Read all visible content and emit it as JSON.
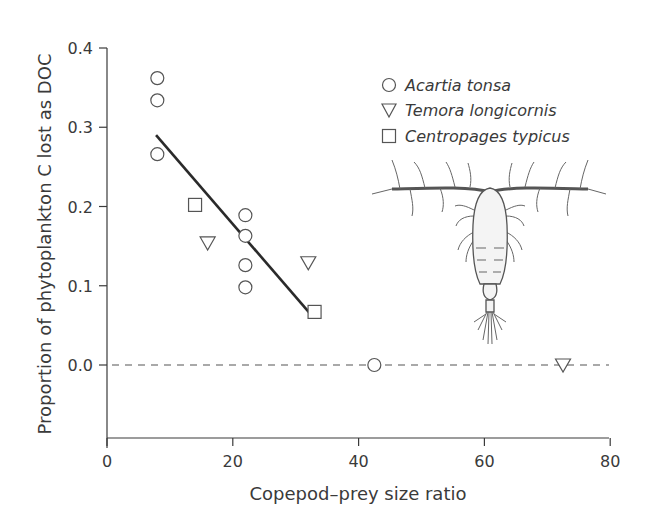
{
  "chart_data": {
    "type": "scatter",
    "title": "",
    "xlabel": "Copepod–prey size ratio",
    "ylabel": "Proportion of phytoplankton C lost as DOC",
    "xlim": [
      0,
      80
    ],
    "ylim": [
      -0.12,
      0.4
    ],
    "xticks": [
      0,
      20,
      40,
      60,
      80
    ],
    "xtick_labels": [
      "0",
      "20",
      "40",
      "60",
      "80"
    ],
    "yticks": [
      0.0,
      0.1,
      0.2,
      0.3,
      0.4
    ],
    "ytick_labels": [
      "0.0",
      "0.1",
      "0.2",
      "0.3",
      "0.4"
    ],
    "grid": false,
    "legend_position": "upper right",
    "series": [
      {
        "name": "Acartia tonsa",
        "marker": "circle",
        "points": [
          {
            "x": 8,
            "y": 0.362
          },
          {
            "x": 8,
            "y": 0.334
          },
          {
            "x": 8,
            "y": 0.266
          },
          {
            "x": 22,
            "y": 0.189
          },
          {
            "x": 22,
            "y": 0.163
          },
          {
            "x": 22,
            "y": 0.126
          },
          {
            "x": 22,
            "y": 0.098
          },
          {
            "x": 42.5,
            "y": 0.0
          }
        ]
      },
      {
        "name": "Temora longicornis",
        "marker": "triangle-down",
        "points": [
          {
            "x": 16,
            "y": 0.154
          },
          {
            "x": 32,
            "y": 0.129
          },
          {
            "x": 72.5,
            "y": 0.0
          }
        ]
      },
      {
        "name": "Centropages typicus",
        "marker": "square",
        "points": [
          {
            "x": 14,
            "y": 0.202
          },
          {
            "x": 33,
            "y": 0.067
          }
        ]
      }
    ],
    "annotations": [
      {
        "type": "regression-line",
        "from": {
          "x": 7.8,
          "y": 0.29
        },
        "to": {
          "x": 32.5,
          "y": 0.063
        }
      },
      {
        "type": "dashed-reference-line",
        "y": 0.0,
        "x_from": 0,
        "x_to": 80
      },
      {
        "type": "illustration",
        "description": "copepod drawing"
      }
    ]
  },
  "legend": {
    "items": [
      {
        "label": "Acartia tonsa",
        "marker": "circle"
      },
      {
        "label": "Temora longicornis",
        "marker": "triangle-down"
      },
      {
        "label": "Centropages typicus",
        "marker": "square"
      }
    ]
  },
  "colors": {
    "axis": "#3a3a3a",
    "marker_stroke": "#555555",
    "fit_line": "#2a2a2a"
  }
}
